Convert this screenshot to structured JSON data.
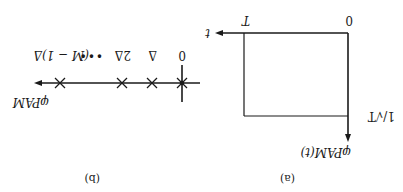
{
  "figure": {
    "orientation": "rotated 180 degrees",
    "colors": {
      "ink": "#1a1a1a",
      "background": "#ffffff"
    },
    "panel_a": {
      "caption": "(a)",
      "y_axis_label": "φPAM(t)",
      "x_axis_label": "t",
      "amplitude_label": "1/√T",
      "tick_labels": {
        "origin": "0",
        "end": "T"
      }
    },
    "panel_b": {
      "caption": "(b)",
      "axis_label": "φPAM",
      "point_labels": [
        "0",
        "Δ",
        "2Δ",
        "•••",
        "(M − 1)Δ"
      ]
    }
  }
}
